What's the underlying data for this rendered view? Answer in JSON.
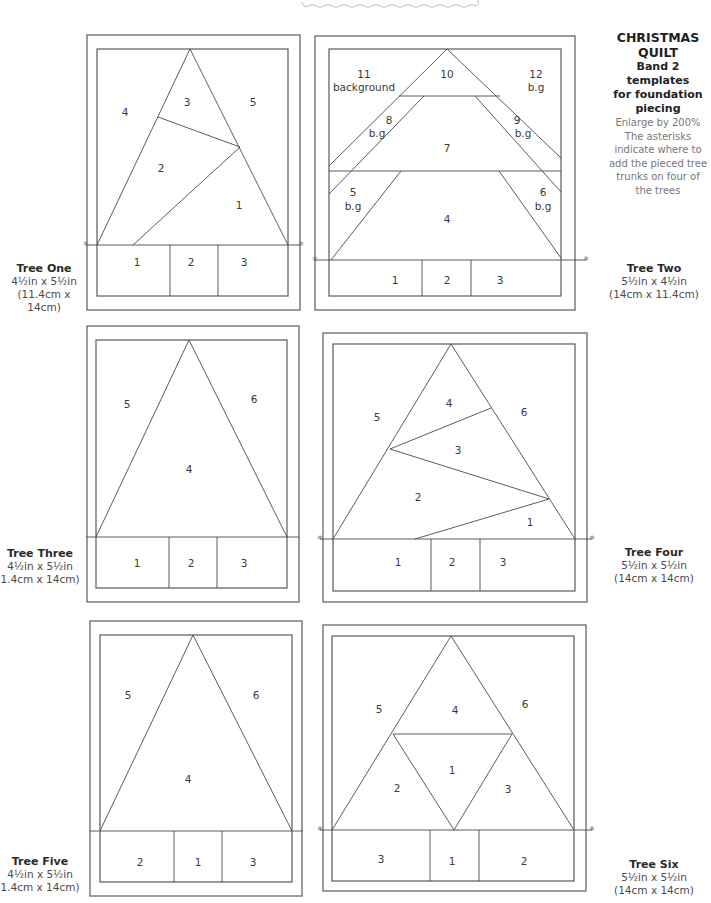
{
  "info": {
    "title_line1": "CHRISTMAS",
    "title_line2": "QUILT",
    "subtitle_line1": "Band 2 templates",
    "subtitle_line2": "for foundation",
    "subtitle_line3": "piecing",
    "note_line1": "Enlarge by 200%",
    "note_line2": "The asterisks",
    "note_line3": "indicate where to",
    "note_line4": "add the pieced tree",
    "note_line5": "trunks on four of",
    "note_line6": "the trees"
  },
  "trees": [
    {
      "name": "Tree One",
      "size_in": "4½in x 5½in",
      "size_cm": "(11.4cm x 14cm)",
      "pieces": [
        "4",
        "3",
        "5",
        "2",
        "1"
      ],
      "trunk": [
        "1",
        "2",
        "3"
      ]
    },
    {
      "name": "Tree Two",
      "size_in": "5½in x 4½in",
      "size_cm": "(14cm x 11.4cm)",
      "pieces": [
        "11",
        "background",
        "10",
        "12",
        "b.g",
        "8",
        "b.g",
        "9",
        "b.g",
        "7",
        "5",
        "b.g",
        "6",
        "b.g",
        "4"
      ],
      "trunk": [
        "1",
        "2",
        "3"
      ]
    },
    {
      "name": "Tree Three",
      "size_in": "4½in x 5½in",
      "size_cm": "1.4cm x 14cm)",
      "pieces": [
        "5",
        "6",
        "4"
      ],
      "trunk": [
        "1",
        "2",
        "3"
      ]
    },
    {
      "name": "Tree Four",
      "size_in": "5½in x 5½in",
      "size_cm": "(14cm x 14cm)",
      "pieces": [
        "4",
        "5",
        "6",
        "3",
        "2",
        "1"
      ],
      "trunk": [
        "1",
        "2",
        "3"
      ]
    },
    {
      "name": "Tree Five",
      "size_in": "4½in x 5½in",
      "size_cm": "1.4cm x 14cm)",
      "pieces": [
        "5",
        "6",
        "4"
      ],
      "trunk": [
        "2",
        "1",
        "3"
      ]
    },
    {
      "name": "Tree Six",
      "size_in": "5½in x 5½in",
      "size_cm": "(14cm x 14cm)",
      "pieces": [
        "5",
        "4",
        "6",
        "1",
        "2",
        "3"
      ],
      "trunk": [
        "3",
        "1",
        "2"
      ]
    }
  ],
  "asterisk": "*"
}
